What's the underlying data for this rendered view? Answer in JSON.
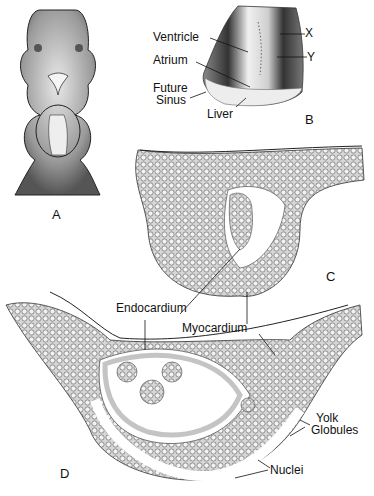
{
  "figure": {
    "panels": [
      "A",
      "B",
      "C",
      "D"
    ],
    "panel_b_labels": {
      "ventricle": "Ventricle",
      "atrium": "Atrium",
      "future": "Future",
      "sinus": "Sinus",
      "liver": "Liver",
      "x": "X",
      "y": "Y"
    },
    "section_labels": {
      "endocardium": "Endocardium",
      "myocardium": "Myocardium",
      "yolk": "Yolk",
      "globules": "Globules",
      "nuclei": "Nuclei"
    },
    "colors": {
      "ink": "#111111",
      "tissue": "#c9c9c9",
      "background": "#ffffff"
    }
  }
}
